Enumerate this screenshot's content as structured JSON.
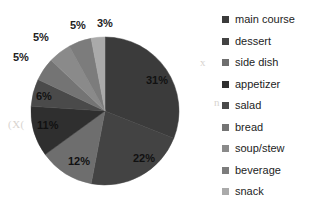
{
  "chart_data": {
    "type": "pie",
    "title": "",
    "subtitle": "",
    "xlabel": "",
    "ylabel": "",
    "legend_position": "right",
    "grid": false,
    "start_angle_deg": 0,
    "direction": "clockwise",
    "units": "percent",
    "total": 100,
    "categories": [
      "main course",
      "dessert",
      "side dish",
      "appetizer",
      "salad",
      "bread",
      "soup/stew",
      "beverage",
      "snack"
    ],
    "values": [
      31,
      22,
      12,
      11,
      6,
      5,
      5,
      5,
      3
    ],
    "data_labels": [
      "31%",
      "22%",
      "12%",
      "11%",
      "6%",
      "5%",
      "5%",
      "5%",
      "3%"
    ],
    "colors": [
      "#3b3b3b",
      "#434343",
      "#6e6e6e",
      "#2f2f2f",
      "#4a4a4a",
      "#747474",
      "#8a8a8a",
      "#7c7c7c",
      "#aaaaaa"
    ],
    "slices": [
      {
        "label": "main course",
        "value": 31,
        "data_label": "31%",
        "color": "#3b3b3b"
      },
      {
        "label": "dessert",
        "value": 22,
        "data_label": "22%",
        "color": "#434343"
      },
      {
        "label": "side dish",
        "value": 12,
        "data_label": "12%",
        "color": "#6e6e6e"
      },
      {
        "label": "appetizer",
        "value": 11,
        "data_label": "11%",
        "color": "#2f2f2f"
      },
      {
        "label": "salad",
        "value": 6,
        "data_label": "6%",
        "color": "#4a4a4a"
      },
      {
        "label": "bread",
        "value": 5,
        "data_label": "5%",
        "color": "#747474"
      },
      {
        "label": "soup/stew",
        "value": 5,
        "data_label": "5%",
        "color": "#8a8a8a"
      },
      {
        "label": "beverage",
        "value": 5,
        "data_label": "5%",
        "color": "#7c7c7c"
      },
      {
        "label": "snack",
        "value": 3,
        "data_label": "3%",
        "color": "#aaaaaa"
      }
    ]
  },
  "legend": {
    "items": [
      {
        "label": "main course",
        "color": "#3b3b3b"
      },
      {
        "label": "dessert",
        "color": "#434343"
      },
      {
        "label": "side dish",
        "color": "#6e6e6e"
      },
      {
        "label": "appetizer",
        "color": "#2f2f2f"
      },
      {
        "label": "salad",
        "color": "#4a4a4a"
      },
      {
        "label": "bread",
        "color": "#747474"
      },
      {
        "label": "soup/stew",
        "color": "#8a8a8a"
      },
      {
        "label": "beverage",
        "color": "#7c7c7c"
      },
      {
        "label": "snack",
        "color": "#aaaaaa"
      }
    ]
  }
}
